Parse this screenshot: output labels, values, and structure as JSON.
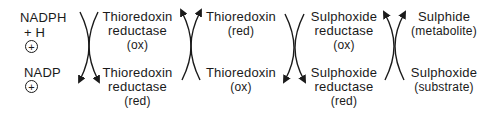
{
  "diagram": {
    "cofactor": {
      "top_line1": "NADPH",
      "top_line2": "+ H",
      "bottom": "NADP",
      "charge": "+"
    },
    "nodes": [
      {
        "id": "trx-reductase-ox",
        "line1": "Thioredoxin",
        "line2": "reductase",
        "line3": "(ox)"
      },
      {
        "id": "trx-reductase-red",
        "line1": "Thioredoxin",
        "line2": "reductase",
        "line3": "(red)"
      },
      {
        "id": "trx-red",
        "line1": "Thioredoxin",
        "line2": "(red)"
      },
      {
        "id": "trx-ox",
        "line1": "Thioredoxin",
        "line2": "(ox)"
      },
      {
        "id": "sulphoxide-reductase-ox",
        "line1": "Sulphoxide",
        "line2": "reductase",
        "line3": "(ox)"
      },
      {
        "id": "sulphoxide-reductase-red",
        "line1": "Sulphoxide",
        "line2": "reductase",
        "line3": "(red)"
      },
      {
        "id": "sulphide",
        "line1": "Sulphide",
        "line2": "(metabolite)"
      },
      {
        "id": "sulphoxide-substrate",
        "line1": "Sulphoxide",
        "line2": "(substrate)"
      }
    ],
    "couplings": [
      {
        "from": [
          "NADPH + H+",
          "Thioredoxin reductase (ox)"
        ],
        "to": [
          "NADP+",
          "Thioredoxin reductase (red)"
        ],
        "direction": "down"
      },
      {
        "from": [
          "Thioredoxin reductase (red)",
          "Thioredoxin (ox)"
        ],
        "to": [
          "Thioredoxin reductase (ox)",
          "Thioredoxin (red)"
        ],
        "direction": "up"
      },
      {
        "from": [
          "Thioredoxin (red)",
          "Sulphoxide reductase (ox)"
        ],
        "to": [
          "Thioredoxin (ox)",
          "Sulphoxide reductase (red)"
        ],
        "direction": "down"
      },
      {
        "from": [
          "Sulphoxide reductase (red)",
          "Sulphoxide (substrate)"
        ],
        "to": [
          "Sulphoxide reductase (ox)",
          "Sulphide (metabolite)"
        ],
        "direction": "up"
      }
    ],
    "color": "#1a1a1a"
  }
}
